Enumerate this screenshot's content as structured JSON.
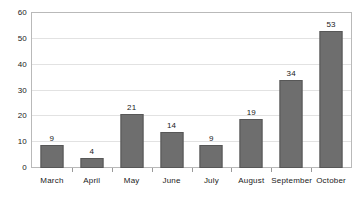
{
  "chart_data": {
    "type": "bar",
    "title": "",
    "subtitle": "",
    "xlabel": "",
    "ylabel": "",
    "categories": [
      "March",
      "April",
      "May",
      "June",
      "July",
      "August",
      "September",
      "October"
    ],
    "values": [
      9,
      4,
      21,
      14,
      9,
      19,
      34,
      53
    ],
    "value_labels": [
      "9",
      "4",
      "21",
      "14",
      "9",
      "19",
      "34",
      "53"
    ],
    "ylim": [
      0,
      60
    ],
    "ytick_step": 10,
    "yticks": [
      60,
      50,
      40,
      30,
      20,
      10,
      0
    ],
    "ytick_labels": [
      "60",
      "50",
      "40",
      "30",
      "20",
      "10",
      "0"
    ],
    "grid": "horizontal",
    "legend": "none",
    "annotations": "value labels displayed above each bar",
    "colors": {
      "bar_fill": "#6e6e6e",
      "bar_stroke": "#575757",
      "gridline": "#e2e2e2",
      "axis_frame": "#b9b9b9",
      "tick_mark": "#9a9a9a",
      "plot_background": "#ffffff",
      "text": "#1a1a1a"
    }
  }
}
